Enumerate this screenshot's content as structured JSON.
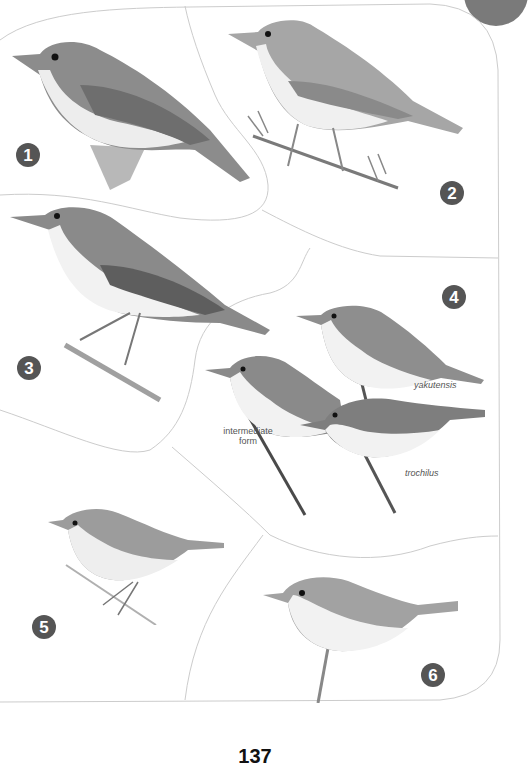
{
  "page": {
    "type": "field guide illustration plate",
    "page_number": "137",
    "tab_color": "#7a7a7a",
    "badge_color": "#555555",
    "divider_color": "#cccccc"
  },
  "panels": [
    {
      "number": "1",
      "birds": [
        {
          "pose": "perched on thick branch, facing left"
        }
      ]
    },
    {
      "number": "2",
      "birds": [
        {
          "pose": "perched on twig with feathery leaves, facing left"
        }
      ]
    },
    {
      "number": "3",
      "birds": [
        {
          "pose": "perched on diagonal branch, facing left"
        }
      ]
    },
    {
      "number": "4",
      "birds": [
        {
          "label": "yakutensis",
          "italic": true
        },
        {
          "label": "intermediate form",
          "italic": false
        },
        {
          "label": "trochilus",
          "italic": true
        }
      ]
    },
    {
      "number": "5",
      "birds": [
        {
          "pose": "perched on thin stem, facing left"
        }
      ]
    },
    {
      "number": "6",
      "birds": [
        {
          "pose": "perched on vertical stem, facing left"
        }
      ]
    }
  ],
  "labels": {
    "yakutensis": "yakutensis",
    "intermediate_line1": "intermediate",
    "intermediate_line2": "form",
    "trochilus": "trochilus"
  }
}
